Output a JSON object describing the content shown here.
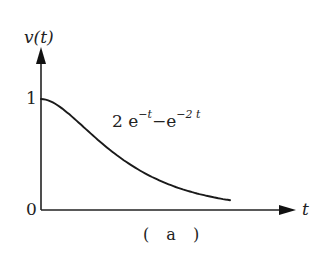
{
  "chart_data": {
    "type": "line",
    "title": "",
    "caption": "( a )",
    "xlabel": "t",
    "ylabel": "v(t)",
    "y_ticks": [
      "0",
      "1"
    ],
    "grid": false,
    "legend": null,
    "annotation": {
      "text_base": "2 e",
      "exp1": "−t",
      "middle": "−e",
      "exp2": "−2 t",
      "full": "2 e^{-t} − e^{-2t}"
    },
    "series": [
      {
        "name": "2e^{-t} - e^{-2t}",
        "x": [
          0,
          0.25,
          0.5,
          0.75,
          1.0,
          1.25,
          1.5,
          1.75,
          2.0,
          2.25,
          2.5,
          2.75,
          3.0,
          3.1
        ],
        "values": [
          1.0,
          0.951,
          0.845,
          0.721,
          0.6,
          0.492,
          0.397,
          0.318,
          0.252,
          0.199,
          0.157,
          0.124,
          0.097,
          0.088
        ]
      }
    ],
    "xlim": [
      0,
      3.9
    ],
    "ylim": [
      0,
      1.6
    ]
  },
  "colors": {
    "ink": "#222222",
    "background": "#ffffff"
  }
}
